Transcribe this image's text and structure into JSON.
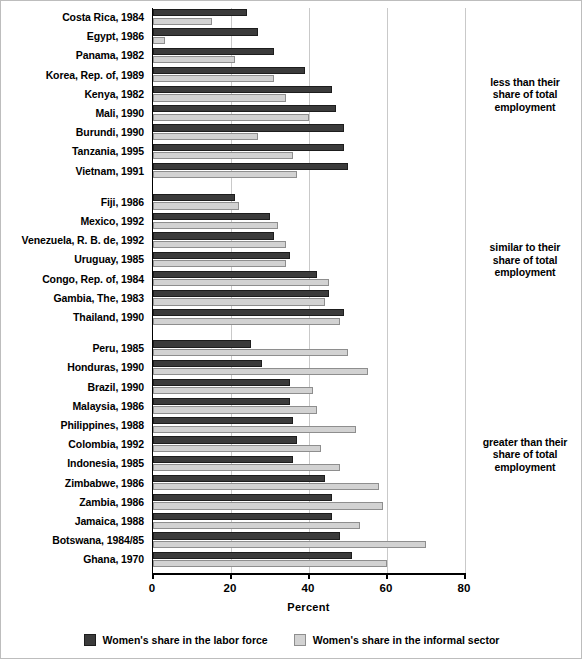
{
  "chart_data": {
    "type": "bar",
    "orientation": "horizontal",
    "title": "",
    "xlabel": "Percent",
    "ylabel": "",
    "xlim": [
      0,
      80
    ],
    "xticks": [
      0,
      20,
      40,
      60,
      80
    ],
    "grid": true,
    "legend_position": "bottom",
    "series": [
      {
        "name": "Women's share in the labor force",
        "color": "#3b3b3b",
        "values": [
          24,
          27,
          31,
          39,
          46,
          47,
          49,
          49,
          50,
          21,
          30,
          31,
          35,
          42,
          45,
          49,
          25,
          28,
          35,
          35,
          36,
          37,
          36,
          44,
          46,
          46,
          48,
          51
        ]
      },
      {
        "name": "Women's share in the informal sector",
        "color": "#d2d2d2",
        "values": [
          15,
          3,
          21,
          31,
          34,
          40,
          27,
          36,
          37,
          22,
          32,
          34,
          34,
          45,
          44,
          48,
          50,
          55,
          41,
          42,
          52,
          43,
          48,
          58,
          59,
          53,
          70,
          60
        ]
      }
    ],
    "categories": [
      "Costa Rica, 1984",
      "Egypt, 1986",
      "Panama, 1982",
      "Korea, Rep. of, 1989",
      "Kenya, 1982",
      "Mali, 1990",
      "Burundi, 1990",
      "Tanzania, 1995",
      "Vietnam, 1991",
      "Fiji, 1986",
      "Mexico, 1992",
      "Venezuela, R. B. de, 1992",
      "Uruguay, 1985",
      "Congo, Rep. of, 1984",
      "Gambia, The, 1983",
      "Thailand, 1990",
      "Peru, 1985",
      "Honduras, 1990",
      "Brazil, 1990",
      "Malaysia, 1986",
      "Philippines, 1988",
      "Colombia, 1992",
      "Indonesia, 1985",
      "Zimbabwe, 1986",
      "Zambia, 1986",
      "Jamaica, 1988",
      "Botswana, 1984/85",
      "Ghana, 1970"
    ],
    "groups": [
      {
        "note": "less than their share of total employment",
        "note_lines": [
          "less than their",
          "share of total",
          "employment"
        ],
        "rows": [
          {
            "label": "Costa Rica, 1984",
            "labor_force": 24,
            "informal": 15
          },
          {
            "label": "Egypt, 1986",
            "labor_force": 27,
            "informal": 3
          },
          {
            "label": "Panama, 1982",
            "labor_force": 31,
            "informal": 21
          },
          {
            "label": "Korea, Rep. of, 1989",
            "labor_force": 39,
            "informal": 31
          },
          {
            "label": "Kenya, 1982",
            "labor_force": 46,
            "informal": 34
          },
          {
            "label": "Mali, 1990",
            "labor_force": 47,
            "informal": 40
          },
          {
            "label": "Burundi, 1990",
            "labor_force": 49,
            "informal": 27
          },
          {
            "label": "Tanzania, 1995",
            "labor_force": 49,
            "informal": 36
          },
          {
            "label": "Vietnam, 1991",
            "labor_force": 50,
            "informal": 37
          }
        ]
      },
      {
        "note": "similar to their share of total employment",
        "note_lines": [
          "similar to their",
          "share of total",
          "employment"
        ],
        "rows": [
          {
            "label": "Fiji, 1986",
            "labor_force": 21,
            "informal": 22
          },
          {
            "label": "Mexico, 1992",
            "labor_force": 30,
            "informal": 32
          },
          {
            "label": "Venezuela, R. B. de, 1992",
            "labor_force": 31,
            "informal": 34
          },
          {
            "label": "Uruguay, 1985",
            "labor_force": 35,
            "informal": 34
          },
          {
            "label": "Congo, Rep. of, 1984",
            "labor_force": 42,
            "informal": 45
          },
          {
            "label": "Gambia, The, 1983",
            "labor_force": 45,
            "informal": 44
          },
          {
            "label": "Thailand, 1990",
            "labor_force": 49,
            "informal": 48
          }
        ]
      },
      {
        "note": "greater than their share of total employment",
        "note_lines": [
          "greater than their",
          "share of total",
          "employment"
        ],
        "rows": [
          {
            "label": "Peru, 1985",
            "labor_force": 25,
            "informal": 50
          },
          {
            "label": "Honduras, 1990",
            "labor_force": 28,
            "informal": 55
          },
          {
            "label": "Brazil, 1990",
            "labor_force": 35,
            "informal": 41
          },
          {
            "label": "Malaysia, 1986",
            "labor_force": 35,
            "informal": 42
          },
          {
            "label": "Philippines, 1988",
            "labor_force": 36,
            "informal": 52
          },
          {
            "label": "Colombia, 1992",
            "labor_force": 37,
            "informal": 43
          },
          {
            "label": "Indonesia, 1985",
            "labor_force": 36,
            "informal": 48
          },
          {
            "label": "Zimbabwe, 1986",
            "labor_force": 44,
            "informal": 58
          },
          {
            "label": "Zambia, 1986",
            "labor_force": 46,
            "informal": 59
          },
          {
            "label": "Jamaica, 1988",
            "labor_force": 46,
            "informal": 53
          },
          {
            "label": "Botswana, 1984/85",
            "labor_force": 48,
            "informal": 70
          },
          {
            "label": "Ghana, 1970",
            "labor_force": 51,
            "informal": 60
          }
        ]
      }
    ]
  },
  "legend": {
    "items": [
      {
        "label": "Women's share in the labor force",
        "color": "#3b3b3b"
      },
      {
        "label": "Women's share in the informal sector",
        "color": "#d2d2d2"
      }
    ]
  },
  "axis": {
    "xlabel": "Percent",
    "ticks": [
      "0",
      "20",
      "40",
      "60",
      "80"
    ]
  }
}
